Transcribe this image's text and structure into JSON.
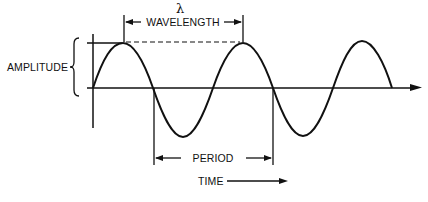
{
  "diagram": {
    "labels": {
      "lambda": "λ",
      "wavelength": "WAVELENGTH",
      "amplitude": "AMPLITUDE",
      "period": "PERIOD",
      "time": "TIME"
    },
    "wave": {
      "shape": "sine",
      "cycles_shown": 2.5,
      "origin_x": 93,
      "axis_y": 88,
      "amplitude_px": 45,
      "period_px": 120,
      "end_x": 392
    },
    "colors": {
      "stroke": "#111111",
      "background": "#ffffff"
    }
  }
}
